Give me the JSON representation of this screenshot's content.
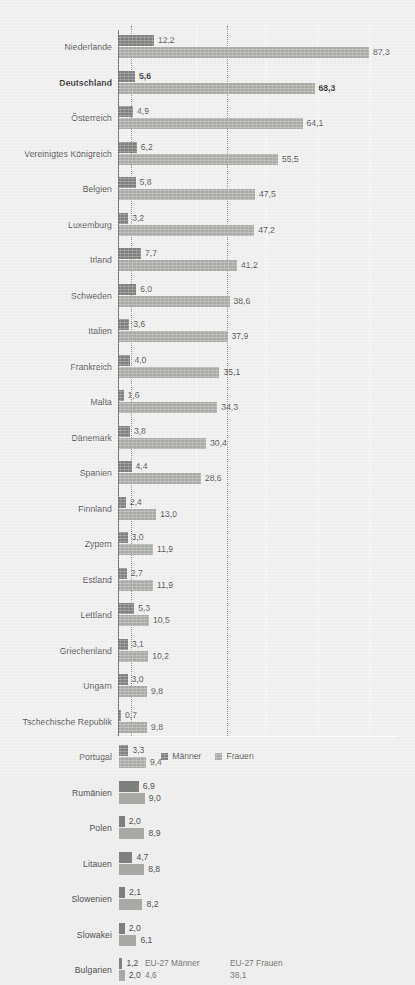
{
  "legend": {
    "maenner_label": "Männer",
    "frauen_label": "Frauen",
    "maenner_color": "#7f807d",
    "frauen_color": "#a9aaa6"
  },
  "annotations": {
    "eu_maenner_label": "EU-27 Männer",
    "eu_maenner_value": "4,6",
    "eu_frauen_label": "EU-27 Frauen",
    "eu_frauen_value": "38,1"
  },
  "chart_data": {
    "type": "bar",
    "orientation": "horizontal",
    "title": "",
    "subtitle": "",
    "xlabel": "",
    "ylabel": "",
    "xlim": [
      0,
      90
    ],
    "grid": true,
    "legend_position": "bottom-center",
    "categories": [
      "Niederlande",
      "Deutschland",
      "Österreich",
      "Vereinigtes Königreich",
      "Belgien",
      "Luxemburg",
      "Irland",
      "Schweden",
      "Italien",
      "Frankreich",
      "Malta",
      "Dänemark",
      "Spanien",
      "Finnland",
      "Zypern",
      "Estland",
      "Lettland",
      "Griechenland",
      "Ungarn",
      "Tschechische Republik",
      "Portugal",
      "Rumänien",
      "Polen",
      "Litauen",
      "Slowenien",
      "Slowakei",
      "Bulgarien"
    ],
    "highlighted_category": "Deutschland",
    "series": [
      {
        "name": "Männer",
        "color": "#7f807d",
        "values": [
          12.2,
          5.6,
          4.9,
          6.2,
          5.8,
          3.2,
          7.7,
          6.0,
          3.6,
          4.0,
          1.6,
          3.8,
          4.4,
          2.4,
          3.0,
          2.7,
          5.3,
          3.1,
          3.0,
          0.7,
          3.3,
          6.9,
          2.0,
          4.7,
          2.1,
          2.0,
          1.2
        ],
        "labels": [
          "12,2",
          "5,6",
          "4,9",
          "6,2",
          "5,8",
          "3,2",
          "7,7",
          "6,0",
          "3,6",
          "4,0",
          "1,6",
          "3,8",
          "4,4",
          "2,4",
          "3,0",
          "2,7",
          "5,3",
          "3,1",
          "3,0",
          "0,7",
          "3,3",
          "6,9",
          "2,0",
          "4,7",
          "2,1",
          "2,0",
          "1,2"
        ]
      },
      {
        "name": "Frauen",
        "color": "#a9aaa6",
        "values": [
          87.3,
          68.3,
          64.1,
          55.5,
          47.5,
          47.2,
          41.2,
          38.6,
          37.9,
          35.1,
          34.3,
          30.4,
          28.6,
          13.0,
          11.9,
          11.9,
          10.5,
          10.2,
          9.8,
          9.8,
          9.4,
          9.0,
          8.9,
          8.8,
          8.2,
          6.1,
          2.0
        ],
        "labels": [
          "87,3",
          "68,3",
          "64,1",
          "55,5",
          "47,5",
          "47,2",
          "41,2",
          "38,6",
          "37,9",
          "35,1",
          "34,3",
          "30,4",
          "28,6",
          "13,0",
          "11,9",
          "11,9",
          "10,5",
          "10,2",
          "9,8",
          "9,8",
          "9,4",
          "9,0",
          "8,9",
          "8,8",
          "8,2",
          "6,1",
          "2,0"
        ]
      }
    ],
    "reference_lines": [
      {
        "name": "EU-27 Männer",
        "value": 4.6,
        "label": "4,6"
      },
      {
        "name": "EU-27 Frauen",
        "value": 38.1,
        "label": "38,1"
      }
    ]
  }
}
